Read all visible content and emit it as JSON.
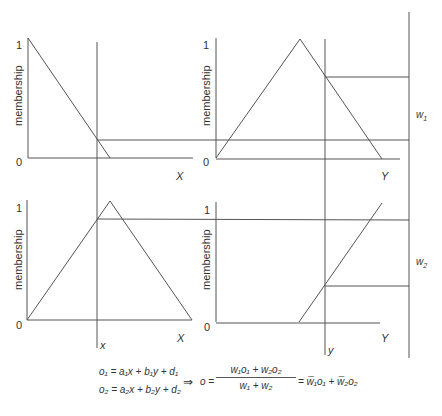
{
  "figure": {
    "panels": [
      {
        "id": "top-left",
        "ylabel": "membership",
        "y_ticks": [
          "1",
          "0"
        ],
        "xlabel": "X",
        "shape": "descending-ramp"
      },
      {
        "id": "top-right",
        "ylabel": "membership",
        "y_ticks": [
          "1",
          "0"
        ],
        "xlabel": "Y",
        "shape": "triangle"
      },
      {
        "id": "bottom-left",
        "ylabel": "membership",
        "y_ticks": [
          "1",
          "0"
        ],
        "xlabel": "X",
        "shape": "triangle"
      },
      {
        "id": "bottom-right",
        "ylabel": "membership",
        "y_ticks": [
          "1",
          "0"
        ],
        "xlabel": "Y",
        "shape": "ascending-ramp"
      }
    ],
    "input_x": "x",
    "input_y": "y",
    "weights": [
      "w1",
      "w2"
    ],
    "w1_base": "w",
    "w1_sub": "1",
    "w2_base": "w",
    "w2_sub": "2"
  },
  "equations": {
    "o1": "o₁ = a₁x + b₁y + d₁",
    "o2": "o₂ = a₂x + b₂y + d₂",
    "implies": "⇒",
    "o_lhs": "o =",
    "numerator": "w₁o₁ + w₂o₂",
    "denominator": "w₁ + w₂",
    "rhs": "= w̅₁o₁ + w̅₂o₂"
  }
}
